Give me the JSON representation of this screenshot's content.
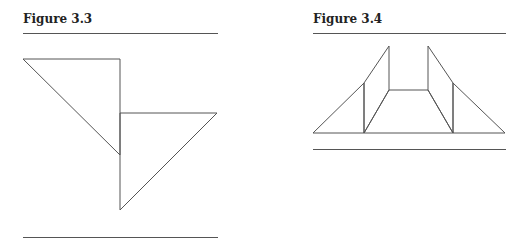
{
  "figures": [
    {
      "title": "Figure 3.3",
      "shapes": [
        {
          "type": "triangle",
          "points": [
            [
              23,
              59
            ],
            [
              120,
              59
            ],
            [
              120,
              155
            ]
          ]
        },
        {
          "type": "triangle",
          "points": [
            [
              120,
              113
            ],
            [
              217,
              113
            ],
            [
              120,
              210
            ]
          ]
        }
      ]
    },
    {
      "title": "Figure 3.4",
      "shapes": [
        {
          "type": "triangle",
          "points": [
            [
              313,
              133
            ],
            [
              364,
              83
            ],
            [
              364,
              133
            ]
          ]
        },
        {
          "type": "quadrilateral",
          "points": [
            [
              364,
              83
            ],
            [
              389,
              46
            ],
            [
              389,
              90
            ],
            [
              364,
              133
            ]
          ]
        },
        {
          "type": "trapezoid",
          "points": [
            [
              389,
              90
            ],
            [
              428,
              90
            ],
            [
              453,
              133
            ],
            [
              364,
              133
            ]
          ]
        },
        {
          "type": "quadrilateral",
          "points": [
            [
              428,
              46
            ],
            [
              453,
              83
            ],
            [
              453,
              133
            ],
            [
              428,
              90
            ]
          ]
        },
        {
          "type": "triangle",
          "points": [
            [
              453,
              83
            ],
            [
              505,
              133
            ],
            [
              453,
              133
            ]
          ]
        }
      ]
    }
  ],
  "colors": {
    "stroke": "#555555",
    "title": "#222222"
  }
}
